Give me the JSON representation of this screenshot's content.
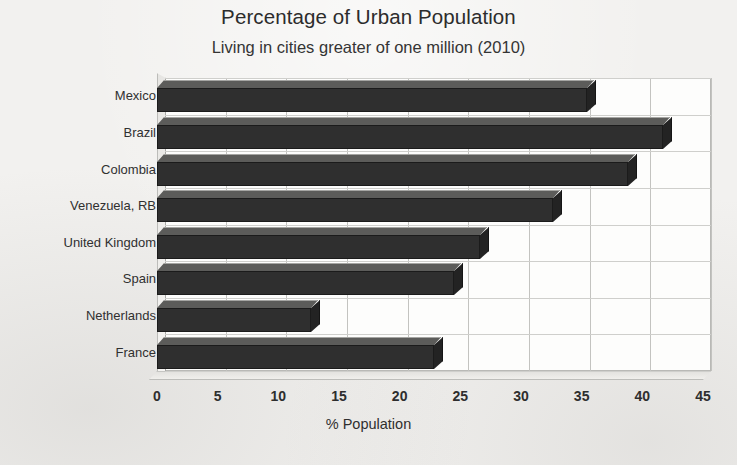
{
  "chart_data": {
    "type": "bar",
    "orientation": "horizontal",
    "title": "Percentage of Urban Population",
    "subtitle": "Living in cities greater of one million (2010)",
    "xlabel": "% Population",
    "ylabel": "",
    "categories": [
      "Mexico",
      "Brazil",
      "Colombia",
      "Venezuela, RB",
      "United Kingdom",
      "Spain",
      "Netherlands",
      "France"
    ],
    "values": [
      35.4,
      41.7,
      38.8,
      32.6,
      26.6,
      24.5,
      12.7,
      22.8
    ],
    "xlim": [
      0,
      45
    ],
    "xticks": [
      0,
      5,
      10,
      15,
      20,
      25,
      30,
      35,
      40,
      45
    ],
    "xtick_labels": [
      "0",
      "5",
      "10",
      "15",
      "20",
      "25",
      "30",
      "35",
      "40",
      "45"
    ],
    "grid": true,
    "grid_axis": "x",
    "legend": false,
    "style_3d": true,
    "bar_color": "#2f2f2f",
    "grid_color": "#c3c3c0",
    "background_color": "#f2f1ef"
  }
}
